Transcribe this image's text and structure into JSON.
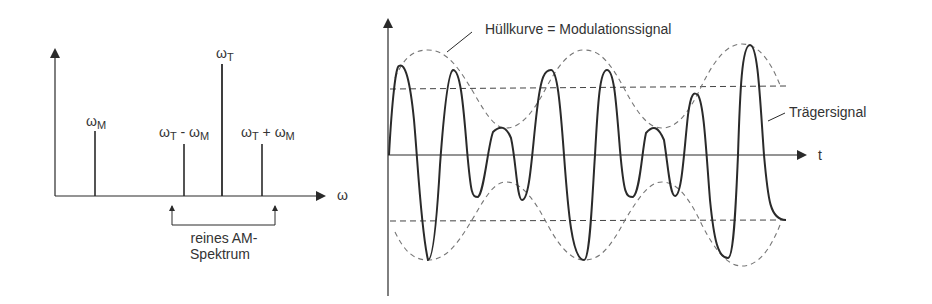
{
  "spectrum": {
    "x_axis_label": "ω",
    "lines": [
      {
        "label_main": "ω",
        "label_sub": "M",
        "x": 95,
        "top": 131
      },
      {
        "label_main": "ω",
        "label_sub": "T",
        "label_mid": " - ω",
        "label_sub2": "M",
        "x": 184,
        "top": 144
      },
      {
        "label_main": "ω",
        "label_sub": "T",
        "x": 222,
        "top": 64
      },
      {
        "label_main": "ω",
        "label_sub": "T",
        "label_mid": " + ω",
        "label_sub2": "M",
        "x": 262,
        "top": 144
      }
    ],
    "bracket_label_line1": "reines AM-",
    "bracket_label_line2": "Spektrum"
  },
  "time_signal": {
    "x_axis_label": "t",
    "envelope_label": "Hüllkurve = Modulationssignal",
    "carrier_label": "Trägersignal"
  },
  "colors": {
    "line": "#2a2a2a",
    "dashed": "#555555",
    "envelope": "#777777"
  }
}
